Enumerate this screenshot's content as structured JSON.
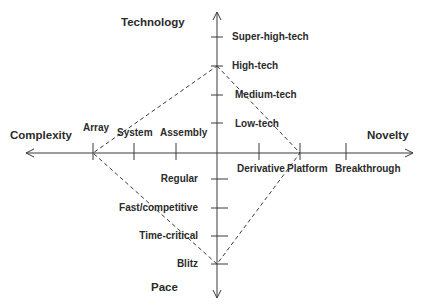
{
  "diagram": {
    "type": "diamond-framework",
    "colors": {
      "line": "#3a3a3a",
      "text": "#2b2b2b",
      "background": "#ffffff"
    },
    "axes": {
      "technology": {
        "title": "Technology",
        "direction": "up",
        "levels": [
          "Low-tech",
          "Medium-tech",
          "High-tech",
          "Super-high-tech"
        ]
      },
      "novelty": {
        "title": "Novelty",
        "direction": "right",
        "levels": [
          "Derivative",
          "Platform",
          "Breakthrough"
        ]
      },
      "pace": {
        "title": "Pace",
        "direction": "down",
        "levels": [
          "Regular",
          "Fast/competitive",
          "Time-critical",
          "Blitz"
        ]
      },
      "complexity": {
        "title": "Complexity",
        "direction": "left",
        "levels": [
          "Assembly",
          "System",
          "Array"
        ]
      }
    },
    "profile": {
      "style": "dashed",
      "technology": "High-tech",
      "novelty": "Platform",
      "pace": "Blitz",
      "complexity": "Array"
    }
  }
}
